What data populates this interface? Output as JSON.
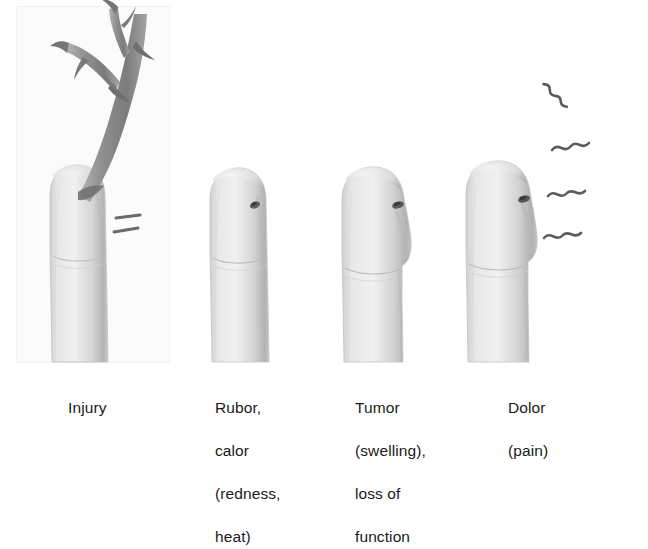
{
  "figure": {
    "medium": "grayscale pencil/airbrush medical illustration",
    "background_color": "#ffffff",
    "ink_color": "#1a1a1a",
    "skin_light": "#ececec",
    "skin_mid": "#d2d2d2",
    "skin_shadow": "#a9a9a9",
    "thorn_color": "#8d8d8d",
    "thorn_shadow": "#6d6d6d"
  },
  "panels": [
    {
      "id": "injury",
      "caption_lines": [
        "Injury"
      ],
      "art": {
        "subject": "finger pricked by a thorny branch",
        "elements": [
          "thorn-branch",
          "finger",
          "puncture-site",
          "injury-marks"
        ],
        "has_background_panel": true
      }
    },
    {
      "id": "rubor-calor",
      "caption_lines": [
        "Rubor,",
        "calor",
        "(redness,",
        "heat)"
      ],
      "art": {
        "subject": "finger with small dark puncture wound",
        "elements": [
          "finger",
          "puncture-wound"
        ],
        "has_background_panel": false
      }
    },
    {
      "id": "tumor",
      "caption_lines": [
        "Tumor",
        "(swelling),",
        "loss of",
        "function"
      ],
      "art": {
        "subject": "visibly swollen finger, bulging contour",
        "elements": [
          "finger",
          "puncture-wound",
          "swelling-bulge"
        ],
        "has_background_panel": false
      }
    },
    {
      "id": "dolor",
      "caption_lines": [
        "Dolor",
        "(pain)"
      ],
      "art": {
        "subject": "swollen finger radiating pain squiggles",
        "elements": [
          "finger",
          "puncture-wound",
          "swelling-bulge",
          "pain-squiggles"
        ],
        "has_background_panel": false
      }
    }
  ]
}
